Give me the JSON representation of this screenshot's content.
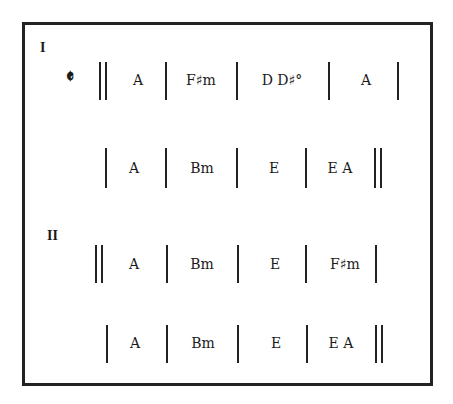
{
  "sections": [
    {
      "label": "I",
      "time_signature": "𝄵",
      "lines": [
        {
          "chords": [
            "A",
            "F♯m",
            "D  D♯°",
            "A"
          ]
        },
        {
          "chords": [
            "A",
            "Bm",
            "E",
            "E  A"
          ]
        }
      ]
    },
    {
      "label": "II",
      "lines": [
        {
          "chords": [
            "A",
            "Bm",
            "E",
            "F♯m"
          ]
        },
        {
          "chords": [
            "A",
            "Bm",
            "E",
            "E  A"
          ]
        }
      ]
    }
  ]
}
